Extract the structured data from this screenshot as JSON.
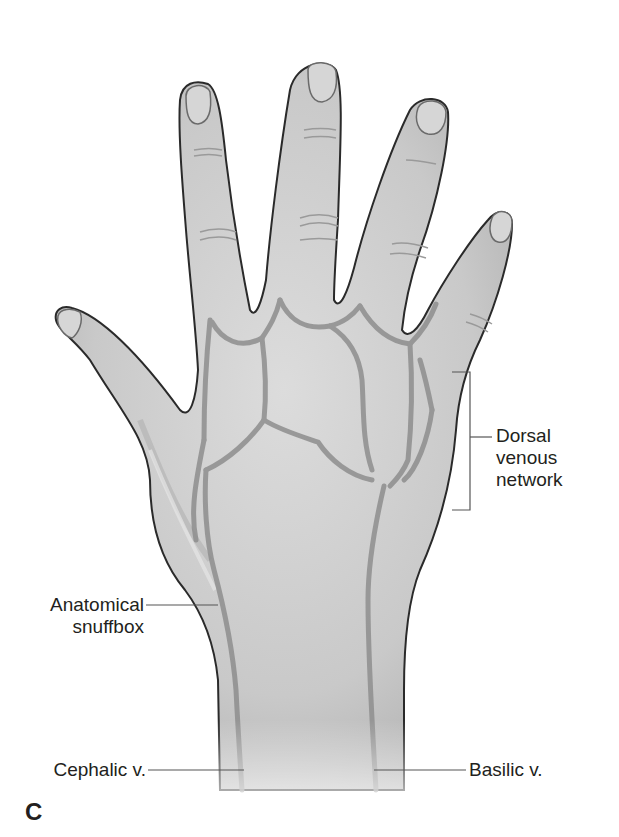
{
  "figure": {
    "panel_letter": "C",
    "colors": {
      "skin": "#cfcfcf",
      "skin_shadow": "#a9a9a9",
      "vein": "#8e8e8e",
      "outline": "#2a2a2a",
      "leader_line": "#555555",
      "text": "#231f20"
    }
  },
  "labels": {
    "dorsal_venous_network": {
      "line1": "Dorsal",
      "line2": "venous",
      "line3": "network"
    },
    "anatomical_snuffbox": {
      "line1": "Anatomical",
      "line2": "snuffbox"
    },
    "cephalic_v": "Cephalic v.",
    "basilic_v": "Basilic v."
  }
}
